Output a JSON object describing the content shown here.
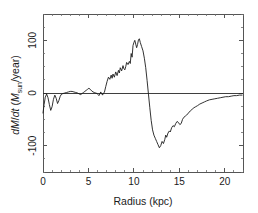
{
  "chart_data": {
    "type": "line",
    "title": "",
    "subtitle": "",
    "xlabel": "Radius (kpc)",
    "ylabel": "dM/dt (Msun/year)",
    "ylabel_parts": {
      "d1": "d",
      "m_italic": "M",
      "slash": "/",
      "d2": "d",
      "t_italic": "t",
      "open_paren": " (",
      "m_sun_italic": "M",
      "sun_subscript": "sun",
      "per_year": "/year)"
    },
    "xlim": [
      0,
      22
    ],
    "ylim": [
      -150,
      150
    ],
    "xticks": [
      0,
      5,
      10,
      15,
      20
    ],
    "xtick_labels": [
      "0",
      "5",
      "10",
      "15",
      "20"
    ],
    "yticks": [
      -100,
      0,
      100
    ],
    "ytick_labels": [
      "-100",
      "0",
      "100"
    ],
    "x_minor_tick_step": 1,
    "y_minor_tick_step": 25,
    "grid": false,
    "legend": null,
    "zero_reference_line": 0,
    "series": [
      {
        "name": "dM/dt",
        "color": "#1c1c1c",
        "x": [
          0.0,
          0.12,
          0.25,
          0.4,
          0.55,
          0.7,
          0.85,
          1.0,
          1.15,
          1.3,
          1.45,
          1.6,
          1.75,
          1.9,
          2.05,
          2.2,
          2.4,
          2.6,
          2.8,
          3.0,
          3.2,
          3.4,
          3.6,
          3.8,
          4.0,
          4.15,
          4.3,
          4.45,
          4.6,
          4.75,
          4.9,
          5.05,
          5.2,
          5.35,
          5.5,
          5.65,
          5.8,
          5.95,
          6.05,
          6.15,
          6.25,
          6.35,
          6.45,
          6.55,
          6.65,
          6.75,
          6.9,
          7.05,
          7.2,
          7.35,
          7.5,
          7.6,
          7.7,
          7.85,
          8.0,
          8.15,
          8.3,
          8.4,
          8.5,
          8.65,
          8.8,
          8.9,
          9.0,
          9.1,
          9.2,
          9.35,
          9.5,
          9.6,
          9.7,
          9.8,
          9.9,
          10.0,
          10.1,
          10.2,
          10.3,
          10.4,
          10.5,
          10.6,
          10.7,
          10.85,
          11.0,
          11.15,
          11.3,
          11.45,
          11.6,
          11.75,
          11.9,
          12.05,
          12.2,
          12.35,
          12.5,
          12.65,
          12.8,
          12.95,
          13.1,
          13.25,
          13.4,
          13.5,
          13.6,
          13.75,
          13.9,
          14.0,
          14.15,
          14.3,
          14.45,
          14.6,
          14.75,
          14.9,
          15.05,
          15.2,
          15.35,
          15.5,
          15.65,
          15.8,
          16.0,
          16.2,
          16.4,
          16.6,
          16.8,
          17.0,
          17.25,
          17.5,
          17.75,
          18.0,
          18.3,
          18.6,
          18.9,
          19.2,
          19.5,
          19.8,
          20.1,
          20.4,
          20.7,
          21.0,
          21.3,
          21.6,
          21.9
        ],
        "y": [
          -38,
          -22,
          -8,
          -2,
          -9,
          -22,
          -33,
          -26,
          -12,
          -4,
          -10,
          -20,
          -14,
          -6,
          -2,
          -1,
          0,
          1,
          2,
          3,
          3,
          2,
          1,
          0,
          -2,
          -3,
          -1,
          1,
          3,
          5,
          7,
          9,
          7,
          4,
          2,
          1,
          0,
          -1,
          -3,
          -5,
          -2,
          2,
          -1,
          -4,
          0,
          1,
          12,
          22,
          30,
          26,
          34,
          28,
          36,
          30,
          40,
          33,
          43,
          38,
          48,
          42,
          52,
          46,
          44,
          50,
          58,
          54,
          60,
          56,
          75,
          68,
          90,
          96,
          100,
          93,
          86,
          92,
          101,
          103,
          96,
          88,
          80,
          66,
          48,
          24,
          -2,
          -28,
          -52,
          -70,
          -80,
          -86,
          -92,
          -98,
          -104,
          -100,
          -92,
          -96,
          -88,
          -80,
          -84,
          -76,
          -72,
          -74,
          -66,
          -62,
          -64,
          -58,
          -54,
          -56,
          -60,
          -58,
          -50,
          -46,
          -44,
          -42,
          -38,
          -34,
          -31,
          -28,
          -26,
          -24,
          -21,
          -19,
          -17,
          -15,
          -13,
          -12,
          -11,
          -10,
          -9,
          -8,
          -7,
          -7,
          -6,
          -5,
          -5,
          -4,
          -4
        ]
      }
    ]
  },
  "figure": {
    "background_color": "#ffffff",
    "axis_color": "#555555",
    "curve_color": "#1c1c1c"
  }
}
